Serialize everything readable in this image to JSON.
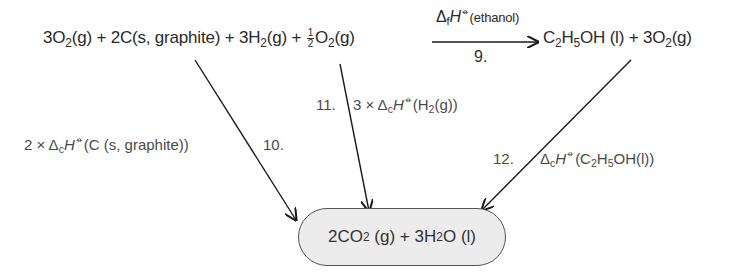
{
  "reaction": {
    "reactants": {
      "t1_coef": "3",
      "t1_sym": "O",
      "t1_sub": "2",
      "t1_state": "(g)",
      "plus1": "+",
      "t2_coef": "2",
      "t2_sym": "C",
      "t2_state": "(s, graphite)",
      "plus2": "+",
      "t3_coef": "3",
      "t3_sym": "H",
      "t3_sub": "2",
      "t3_state": "(g)",
      "plus3": "+",
      "t4_num": "1",
      "t4_den": "2",
      "t4_sym": "O",
      "t4_sub": "2",
      "t4_state": "(g)"
    },
    "arrow": {
      "delta": "Δ",
      "delta_sub": "f",
      "H": "H",
      "plimsoll": "⦵",
      "qualifier": "(ethanol)",
      "step": "9."
    },
    "products": {
      "p1_a": "C",
      "p1_a_sub": "2",
      "p1_b": "H",
      "p1_b_sub": "5",
      "p1_c": "OH",
      "p1_state": "(l)",
      "plus": "+",
      "p2_coef": "3",
      "p2_sym": "O",
      "p2_sub": "2",
      "p2_state": "(g)"
    }
  },
  "paths": [
    {
      "step": "10.",
      "prefix": "2 × ",
      "delta": "Δ",
      "delta_sub": "c",
      "H": "H",
      "plimsoll": "⦵",
      "species": "(C (s, graphite))"
    },
    {
      "step": "11.",
      "prefix": "3 × ",
      "delta": "Δ",
      "delta_sub": "c",
      "H": "H",
      "plimsoll": "⦵",
      "species_a": "(H",
      "species_sub": "2",
      "species_b": "(g))"
    },
    {
      "step": "12.",
      "delta": "Δ",
      "delta_sub": "c",
      "H": "H",
      "plimsoll": "⦵",
      "species_a": "(C",
      "sub1": "2",
      "species_b": "H",
      "sub2": "5",
      "species_c": "OH(l))"
    }
  ],
  "combustion_products": {
    "a_coef": "2",
    "a_sym": "CO",
    "a_sub": "2",
    "a_state": "(g)",
    "plus": "+",
    "b_coef": "3",
    "b_sym": "H",
    "b_sub": "2",
    "b_sym2": "O",
    "b_state": "(l)"
  },
  "colors": {
    "line": "#1a1a1a",
    "pill_fill": "#ececec",
    "pill_border": "#555555",
    "label_text": "#4a4a4a"
  }
}
